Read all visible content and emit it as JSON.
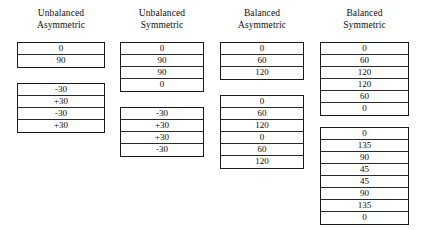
{
  "figure": {
    "background_color": "#ffffff",
    "line_color": "#1a1a1a",
    "text_color": "#0b0b0b"
  },
  "columns": [
    {
      "id": "unbalanced-asymmetric",
      "header_line1": "Unbalanced",
      "header_line2": "Asymmetric",
      "laminates": [
        {
          "id": "laminate-1",
          "top": 42,
          "plies": [
            "0",
            "90"
          ]
        },
        {
          "id": "laminate-2",
          "top": 83,
          "plies": [
            "-30",
            "+30",
            "-30",
            "+30"
          ]
        }
      ]
    },
    {
      "id": "unbalanced-symmetric",
      "header_line1": "Unbalanced",
      "header_line2": "Symmetric",
      "laminates": [
        {
          "id": "laminate-1",
          "top": 42,
          "plies": [
            "0",
            "90",
            "90",
            "0"
          ]
        },
        {
          "id": "laminate-2",
          "top": 107,
          "plies": [
            "-30",
            "+30",
            "+30",
            "-30"
          ]
        }
      ]
    },
    {
      "id": "balanced-asymmetric",
      "header_line1": "Balanced",
      "header_line2": "Asymmetric",
      "laminates": [
        {
          "id": "laminate-1",
          "top": 42,
          "plies": [
            "0",
            "60",
            "120"
          ]
        },
        {
          "id": "laminate-2",
          "top": 95,
          "plies": [
            "0",
            "60",
            "120",
            "0",
            "60",
            "120"
          ]
        }
      ]
    },
    {
      "id": "balanced-symmetric",
      "header_line1": "Balanced",
      "header_line2": "Symmetric",
      "laminates": [
        {
          "id": "laminate-1",
          "top": 42,
          "plies": [
            "0",
            "60",
            "120",
            "120",
            "60",
            "0"
          ]
        },
        {
          "id": "laminate-2",
          "top": 127,
          "plies": [
            "0",
            "135",
            "90",
            "45",
            "45",
            "90",
            "135",
            "0"
          ]
        }
      ]
    }
  ]
}
